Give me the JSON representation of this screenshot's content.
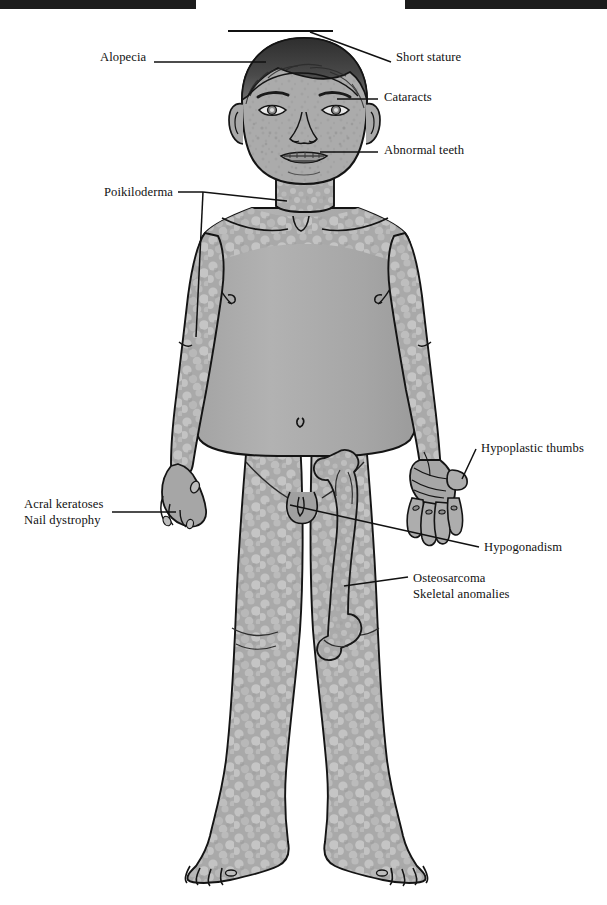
{
  "figure": {
    "colors": {
      "skin": "#a8a8a8",
      "skin_light": "#c2c2c2",
      "outline": "#141414",
      "bone": "#b4b4b4",
      "bar": "#1c1c1c",
      "background": "#ffffff"
    },
    "scan_bars": [
      {
        "name": "top-left-bar"
      },
      {
        "name": "top-right-bar"
      }
    ]
  },
  "annotations": {
    "alopecia": {
      "label": "Alopecia",
      "x": 100,
      "y": 57
    },
    "short_stature": {
      "label": "Short stature",
      "x": 396,
      "y": 57
    },
    "cataracts": {
      "label": "Cataracts",
      "x": 384,
      "y": 93
    },
    "abnormal_teeth": {
      "label": "Abnormal teeth",
      "x": 384,
      "y": 146
    },
    "poikiloderma": {
      "label": "Poikiloderma",
      "x": 104,
      "y": 188
    },
    "hypoplastic_thumbs": {
      "label": "Hypoplastic thumbs",
      "x": 481,
      "y": 443
    },
    "acral_keratoses": {
      "line1": "Acral keratoses",
      "line2": "Nail dystrophy",
      "x": 24,
      "y": 502
    },
    "hypogonadism": {
      "label": "Hypogonadism",
      "x": 484,
      "y": 540
    },
    "osteosarcoma": {
      "line1": "Osteosarcoma",
      "line2": "Skeletal anomalies",
      "x": 413,
      "y": 571
    }
  }
}
